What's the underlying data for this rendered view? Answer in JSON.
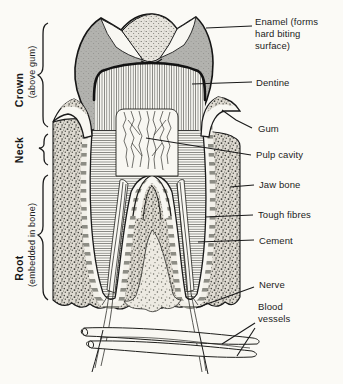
{
  "figure": {
    "type": "anatomical line diagram",
    "colors": {
      "paper": "#fbfaf6",
      "ink": "#1a1a1a",
      "enamel_gray": "#b2b2ae",
      "bone_tone": "#dedad1",
      "fibre_stripe": "#8d8d85"
    }
  },
  "part_labels": {
    "enamel": "Enamel (forms hard biting surface)",
    "dentine": "Dentine",
    "gum": "Gum",
    "pulp_cavity": "Pulp cavity",
    "jaw_bone": "Jaw bone",
    "tough_fibres": "Tough fibres",
    "cement": "Cement",
    "nerve": "Nerve",
    "blood_vessels": "Blood vessels"
  },
  "region_labels": {
    "crown": "Crown",
    "crown_sub": "(above gum)",
    "neck": "Neck",
    "root": "Root",
    "root_sub": "(embedded in bone)"
  }
}
